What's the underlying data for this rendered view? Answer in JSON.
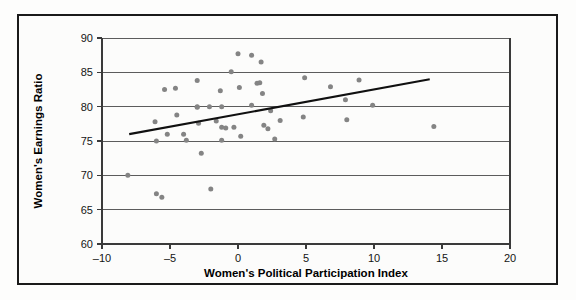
{
  "figure": {
    "background_color": "#fcfcfb",
    "frame_color": "#1a1a1a",
    "marker_color": "#848484",
    "trendline_color": "#101010",
    "gridline_color": "#4a4a4a"
  },
  "chart_data": {
    "type": "scatter",
    "title": "",
    "xlabel": "Women's Political Participation Index",
    "ylabel": "Women's Earnings Ratio",
    "xlim": [
      -10,
      20
    ],
    "ylim": [
      60,
      90
    ],
    "xticks": [
      -10,
      -5,
      0,
      5,
      10,
      15,
      20
    ],
    "xtick_labels": [
      "-10",
      "-5",
      "0",
      "5",
      "10",
      "15",
      "20"
    ],
    "yticks": [
      60,
      65,
      70,
      75,
      80,
      85,
      90
    ],
    "ytick_labels": [
      "60",
      "65",
      "70",
      "75",
      "80",
      "85",
      "90"
    ],
    "grid": "horizontal",
    "legend": "none",
    "marker_size": 5,
    "points": [
      [
        -8.1,
        70.0
      ],
      [
        -6.1,
        77.8
      ],
      [
        -6.0,
        75.0
      ],
      [
        -6.0,
        67.3
      ],
      [
        -5.6,
        66.8
      ],
      [
        -5.4,
        82.5
      ],
      [
        -5.2,
        76.0
      ],
      [
        -4.6,
        82.7
      ],
      [
        -4.5,
        78.8
      ],
      [
        -4.0,
        76.0
      ],
      [
        -3.8,
        75.1
      ],
      [
        -3.0,
        83.8
      ],
      [
        -3.0,
        80.0
      ],
      [
        -3.0,
        79.9
      ],
      [
        -2.9,
        77.6
      ],
      [
        -2.7,
        73.2
      ],
      [
        -2.1,
        80.0
      ],
      [
        -2.0,
        68.0
      ],
      [
        -1.6,
        77.9
      ],
      [
        -1.3,
        82.3
      ],
      [
        -1.2,
        80.0
      ],
      [
        -1.2,
        77.0
      ],
      [
        -1.2,
        75.1
      ],
      [
        -0.9,
        76.9
      ],
      [
        -0.5,
        85.1
      ],
      [
        -0.3,
        77.0
      ],
      [
        0.0,
        87.7
      ],
      [
        0.1,
        82.8
      ],
      [
        0.2,
        75.7
      ],
      [
        1.0,
        87.5
      ],
      [
        1.0,
        80.2
      ],
      [
        1.4,
        83.4
      ],
      [
        1.6,
        83.5
      ],
      [
        1.7,
        86.5
      ],
      [
        1.8,
        81.9
      ],
      [
        1.9,
        77.3
      ],
      [
        2.2,
        76.8
      ],
      [
        2.4,
        79.4
      ],
      [
        2.7,
        75.3
      ],
      [
        3.1,
        78.0
      ],
      [
        4.8,
        78.5
      ],
      [
        4.9,
        84.2
      ],
      [
        6.8,
        82.9
      ],
      [
        7.9,
        81.0
      ],
      [
        8.0,
        78.1
      ],
      [
        8.9,
        83.9
      ],
      [
        9.9,
        80.2
      ],
      [
        14.4,
        77.1
      ]
    ],
    "trendline": {
      "x": [
        -8.0,
        14.1
      ],
      "y": [
        76.0,
        84.0
      ]
    }
  }
}
